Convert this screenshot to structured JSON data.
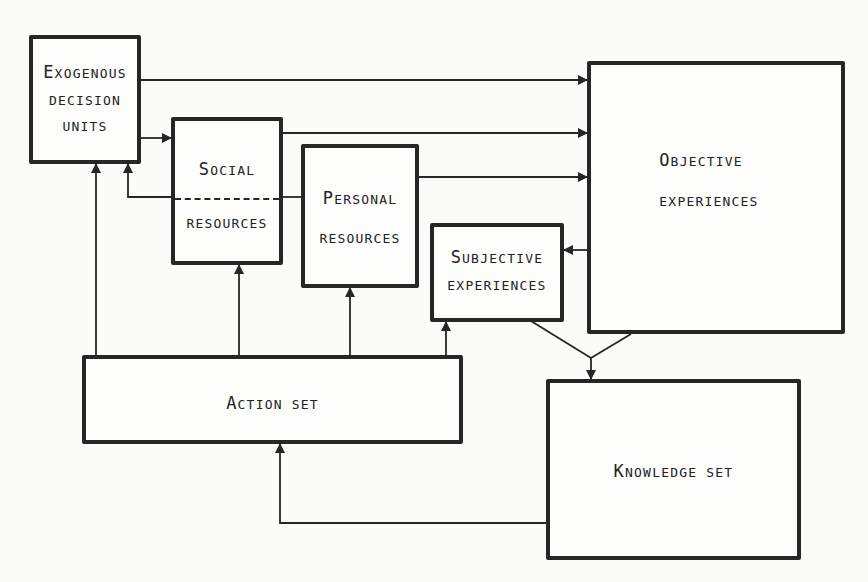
{
  "diagram": {
    "type": "flow",
    "stroke_color": "#262626",
    "background": "#fbfbfa",
    "nodes": {
      "exogenous": {
        "cap": "E",
        "line1": "XOGENOUS",
        "line2": "DECISION",
        "line3": "UNITS"
      },
      "social": {
        "cap": "S",
        "line1": "OCIAL",
        "line2": "RESOURCES"
      },
      "personal": {
        "cap": "P",
        "line1": "ERSONAL",
        "line2": "RESOURCES"
      },
      "subjective": {
        "cap": "S",
        "line1": "UBJECTIVE",
        "line2": "EXPERIENCES"
      },
      "objective": {
        "cap": "O",
        "line1": "BJECTIVE",
        "line2": "EXPERIENCES"
      },
      "action": {
        "cap": "A",
        "line1": "CTION SET"
      },
      "knowledge": {
        "cap": "K",
        "line1": "NOWLEDGE SET"
      }
    },
    "edges": [
      {
        "from": "Exogenous decision units",
        "to": "Objective experiences"
      },
      {
        "from": "Exogenous decision units",
        "to": "Social resources"
      },
      {
        "from": "Social resources",
        "to": "Objective experiences"
      },
      {
        "from": "Social resources",
        "to": "Exogenous decision units"
      },
      {
        "from": "Social resources",
        "to": "Personal resources",
        "style": "dashed"
      },
      {
        "from": "Personal resources",
        "to": "Objective experiences"
      },
      {
        "from": "Objective experiences",
        "to": "Subjective experiences"
      },
      {
        "from": "Subjective experiences",
        "to": "Knowledge set"
      },
      {
        "from": "Objective experiences",
        "to": "Knowledge set"
      },
      {
        "from": "Action set",
        "to": "Exogenous decision units"
      },
      {
        "from": "Action set",
        "to": "Social resources"
      },
      {
        "from": "Action set",
        "to": "Personal resources"
      },
      {
        "from": "Action set",
        "to": "Subjective experiences"
      },
      {
        "from": "Knowledge set",
        "to": "Action set"
      }
    ]
  }
}
